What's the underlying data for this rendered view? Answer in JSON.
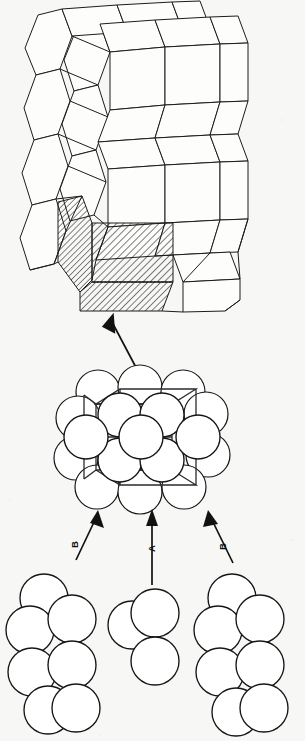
{
  "figure": {
    "background_color": "#f7f7f5",
    "line_color": "#1c1c1c",
    "width": 305,
    "height": 741
  },
  "panels": {
    "top": {
      "name": "hexagonal-prism-array",
      "description": "Array of stacked hexagonal prism unit cells, one cell shaded with diagonal hatching",
      "prism_count": 9,
      "highlighted_cell": "front-bottom-left",
      "hatch_color": "#1c1c1c"
    },
    "middle": {
      "name": "unit-cell-with-atoms",
      "description": "Single hexagonal prism unit cell drawn with hard-sphere atoms at lattice sites",
      "sphere_count": 17,
      "sphere_fill": "#ffffff",
      "sphere_stroke": "#161616"
    },
    "bottom": {
      "name": "close-packed-layers",
      "description": "Three close-packed atom layers that stack to form the ABA sequence",
      "clusters": [
        {
          "label": "B",
          "sphere_count": 7,
          "position": "left"
        },
        {
          "label": "A",
          "sphere_count": 3,
          "position": "center"
        },
        {
          "label": "B",
          "sphere_count": 7,
          "position": "right"
        }
      ]
    }
  },
  "labels": {
    "layer_b_left": "B",
    "layer_a_center": "A",
    "layer_b_right": "B"
  },
  "arrows": [
    {
      "name": "arrow-cell-to-array",
      "from": "unit-cell-with-atoms",
      "to": "hexagonal-prism-array"
    },
    {
      "name": "arrow-layer-b-left",
      "from": "layer-b-left",
      "to": "unit-cell-with-atoms",
      "label": "B"
    },
    {
      "name": "arrow-layer-a-center",
      "from": "layer-a-center",
      "to": "unit-cell-with-atoms",
      "label": "A"
    },
    {
      "name": "arrow-layer-b-right",
      "from": "layer-b-right",
      "to": "unit-cell-with-atoms",
      "label": "B"
    }
  ]
}
